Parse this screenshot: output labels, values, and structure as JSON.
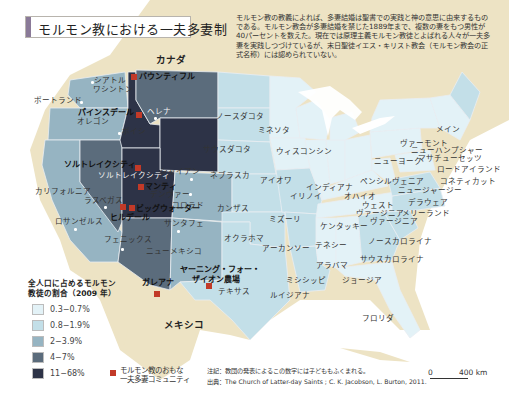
{
  "title": "モルモン教における一夫多妻制",
  "intro_text": "モルモン教の教義によれば、多妻結婚は聖書での実践と神の意思に由来するものである。モルモン教会が多妻結婚を禁じた1889年まで、複数の妻をもつ男性が40パーセントを数えた。現在では原理主義モルモン教徒とよばれる人々が一夫多妻を実践しつづけているが、末日聖徒イエス・キリスト教会（モルモン教会の正式名称）には認められていない。",
  "colors": {
    "land_background": "#ede3c4",
    "sea": "#ffffff",
    "cat1": "#e3f2f7",
    "cat2": "#c3dfe8",
    "cat3": "#96b4c2",
    "cat4": "#5b6c7c",
    "cat5": "#2d3347",
    "community_marker": "#c23a28",
    "title_bar": "#8a7a98"
  },
  "countries": {
    "canada": "カナダ",
    "mexico": "メキシコ"
  },
  "states": {
    "washington": "ワシントン",
    "oregon": "オレゴン",
    "california": "カリフォルニア",
    "north_dakota": "ノースダコタ",
    "south_dakota": "サウスダコタ",
    "nebraska": "ネブラスカ",
    "kansas": "カンザス",
    "oklahoma": "オクラホマ",
    "texas": "テキサス",
    "new_mexico": "ニューメキシコ",
    "colorado": "コロラド",
    "minnesota": "ミネソタ",
    "iowa": "アイオワ",
    "missouri": "ミズーリ",
    "arkansas": "アーカンソー",
    "louisiana": "ルイジアナ",
    "wisconsin": "ウィスコンシン",
    "illinois": "イリノイ",
    "indiana": "インディアナ",
    "ohio": "オハイオ",
    "kentucky": "ケンタッキー",
    "tennessee": "テネシー",
    "mississippi": "ミシシッピ",
    "alabama": "アラバマ",
    "georgia": "ジョージア",
    "florida": "フロリダ",
    "south_carolina": "サウスカロライナ",
    "north_carolina": "ノースカロライナ",
    "virginia": "ヴァージニア",
    "west_virginia": "ウェスト\nヴァージニア",
    "west_virginia_1": "ウェスト",
    "west_virginia_2": "ヴァージニア",
    "maryland": "メリーランド",
    "delaware": "デラウェア",
    "new_jersey": "ニュージャージー",
    "pennsylvania": "ペンシルヴェニア",
    "new_york": "ニューヨーク",
    "connecticut": "コネティカット",
    "rhode_island": "ロードアイランド",
    "massachusetts": "マサチューセッツ",
    "new_hampshire": "ニューハンプシャー",
    "vermont": "ヴァーモント",
    "maine": "メイン"
  },
  "cities": {
    "seattle": "シアトル",
    "portland": "ポートランド",
    "helena": "ヘレナ",
    "boise": "ボイシ",
    "salt_lake_city": "ソルトレイクシティ",
    "cheyenne": "シャイアン",
    "denver": "デンヴァー",
    "las_vegas": "ラスベガス",
    "los_angeles": "ロサンゼルス",
    "phoenix": "フェニックス",
    "santa_fe": "サンタフェ"
  },
  "communities": {
    "bountiful": "バウンティフル",
    "pinesdale": "パインスデール",
    "salt_lake_city": "ソルトレイクシティ",
    "manti": "マンティ",
    "big_water": "ビッグウォーター",
    "hildale": "ヒルデール",
    "yearning_1": "ヤーニング・フォー・",
    "yearning_2": "ザイオン農場",
    "galeana": "ガレアナ"
  },
  "legend": {
    "title_line1": "全人口に占めるモルモン",
    "title_line2": "教徒の割合（2009 年）",
    "items": [
      {
        "label": "0.3−0.7%",
        "color": "#e3f2f7"
      },
      {
        "label": "0.8−1.9%",
        "color": "#c3dfe8"
      },
      {
        "label": "2−3.9%",
        "color": "#96b4c2"
      },
      {
        "label": "4−7%",
        "color": "#5b6c7c"
      },
      {
        "label": "11−68%",
        "color": "#2d3347"
      }
    ],
    "community_line1": "モルモン教のおもな",
    "community_line2": "一夫多妻コミュニティ"
  },
  "notes": {
    "note": "注記：教団の発表によるこの数字には子どももふくまれる。",
    "source": "出典：The Church of Latter-day Saints ; C. K. Jacobson, L. Burton, 2011."
  },
  "scale": {
    "zero": "0",
    "max": "400 km"
  }
}
